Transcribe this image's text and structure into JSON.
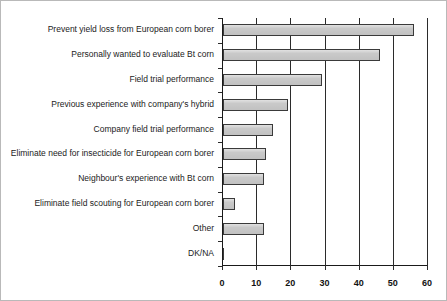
{
  "chart_data": {
    "type": "bar",
    "orientation": "horizontal",
    "title": "",
    "subtitle": "",
    "xlabel": "",
    "ylabel": "",
    "xlim": [
      0,
      60
    ],
    "xticks": [
      0,
      10,
      20,
      30,
      40,
      50,
      60
    ],
    "xtick_labels": [
      "0",
      "10",
      "20",
      "30",
      "40",
      "50",
      "60"
    ],
    "grid": true,
    "grid_axis": "x",
    "legend": false,
    "legend_position": "none",
    "categories": [
      "Prevent yield loss from European corn borer",
      "Personally wanted to evaluate Bt corn",
      "Field trial performance",
      "Previous experience with company's hybrid",
      "Company field trial performance",
      "Eliminate need for insecticide for European corn borer",
      "Neighbour's experience with Bt corn",
      "Eliminate field scouting for European corn borer",
      "Other",
      "DK/NA"
    ],
    "values": [
      56,
      46,
      29,
      19,
      14.5,
      12.5,
      12,
      3.5,
      12,
      0
    ],
    "bar_fill_color": "#c9c9c9",
    "bar_border_color": "#3a3a3a",
    "axis_color": "#1a1a1a",
    "grid_color": "#2b2b2b",
    "text_color": "#222222"
  }
}
